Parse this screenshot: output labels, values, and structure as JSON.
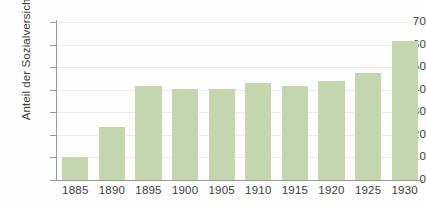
{
  "figure": {
    "cropped_title_remnant": "",
    "background_color": "#fefefe",
    "bar_color": "#c4d6ae",
    "grid_color": "#ececec",
    "axis_color": "#9a9a9a",
    "text_color": "#3c3c3c"
  },
  "chart_data": {
    "type": "bar",
    "title": "",
    "xlabel": "",
    "ylabel": "Anteil der Sozialversicherten",
    "categories": [
      "1885",
      "1890",
      "1895",
      "1900",
      "1905",
      "1910",
      "1915",
      "1920",
      "1925",
      "1930"
    ],
    "values": [
      10,
      23.5,
      41.5,
      40.5,
      40.5,
      43,
      41.5,
      44,
      47.5,
      61.5
    ],
    "ylim": [
      0,
      70
    ],
    "yticks": [
      0,
      10,
      20,
      30,
      40,
      50,
      60,
      70
    ],
    "ytick_labels": [
      "0",
      "10",
      "20",
      "30",
      "40",
      "50",
      "60",
      "70"
    ],
    "grid": "horizontal",
    "legend": "none",
    "series": [
      {
        "name": "Anteil der Sozialversicherten",
        "values": [
          10,
          23.5,
          41.5,
          40.5,
          40.5,
          43,
          41.5,
          44,
          47.5,
          61.5
        ]
      }
    ]
  }
}
